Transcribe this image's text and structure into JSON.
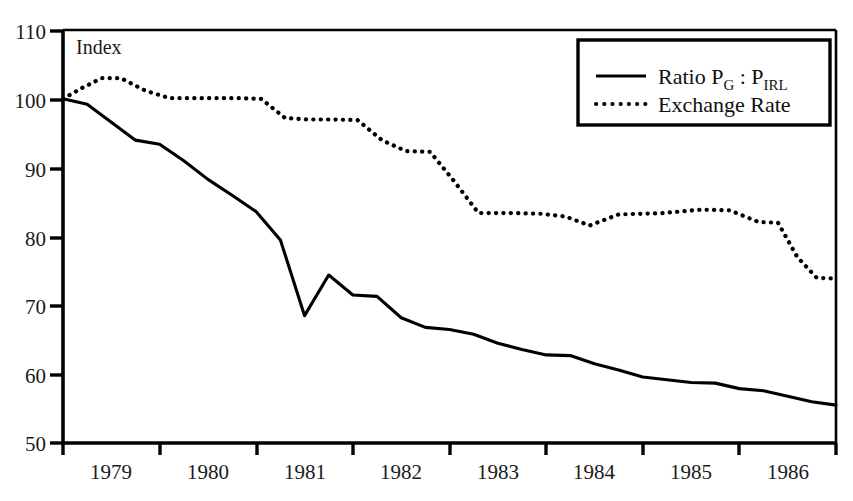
{
  "chart_data": {
    "type": "line",
    "title": "",
    "xlabel": "",
    "ylabel": "Index",
    "axis_corner_label": "Index",
    "xlim": [
      1978.5,
      1986.5
    ],
    "ylim": [
      50,
      110
    ],
    "grid": false,
    "legend_position": "top-right",
    "y_ticks": [
      50,
      60,
      70,
      80,
      90,
      100,
      110
    ],
    "y_tick_labels": [
      "50",
      "60",
      "70",
      "80",
      "90",
      "100",
      "110"
    ],
    "x_tick_labels": [
      "1979",
      "1980",
      "1981",
      "1982",
      "1983",
      "1984",
      "1985",
      "1986"
    ],
    "x_tick_values": [
      1979,
      1980,
      1981,
      1982,
      1983,
      1984,
      1985,
      1986
    ],
    "x_boundary_ticks": [
      1978.5,
      1979.5,
      1980.5,
      1981.5,
      1982.5,
      1983.5,
      1984.5,
      1985.5,
      1986.5
    ],
    "colors": {
      "line": "#000000",
      "axis": "#000000",
      "background": "#ffffff",
      "text": "#1a1a1a"
    },
    "series": [
      {
        "name": "Ratio P_G : P_IRL",
        "legend_label_main": "Ratio P",
        "legend_sub_1": "G",
        "legend_mid": " : P",
        "legend_sub_2": "IRL",
        "style": "solid",
        "x": [
          1978.5,
          1978.75,
          1979.0,
          1979.25,
          1979.5,
          1979.75,
          1980.0,
          1980.25,
          1980.5,
          1980.75,
          1981.0,
          1981.25,
          1981.5,
          1981.75,
          1982.0,
          1982.25,
          1982.5,
          1982.75,
          1983.0,
          1983.25,
          1983.5,
          1983.75,
          1984.0,
          1984.25,
          1984.5,
          1984.75,
          1985.0,
          1985.25,
          1985.5,
          1985.75,
          1986.0,
          1986.25,
          1986.5
        ],
        "values": [
          100.0,
          99.2,
          96.6,
          94.0,
          93.4,
          91.0,
          88.3,
          86.0,
          83.6,
          79.5,
          68.5,
          74.4,
          71.5,
          71.3,
          68.2,
          66.8,
          66.5,
          65.8,
          64.5,
          63.6,
          62.8,
          62.7,
          61.5,
          60.6,
          59.6,
          59.2,
          58.8,
          58.7,
          57.9,
          57.6,
          56.8,
          56.0,
          55.5
        ]
      },
      {
        "name": "Exchange Rate",
        "legend_label_main": "Exchange Rate",
        "style": "dotted",
        "x": [
          1978.5,
          1978.7,
          1978.9,
          1979.1,
          1979.35,
          1979.6,
          1980.0,
          1980.3,
          1980.55,
          1980.8,
          1981.05,
          1981.3,
          1981.55,
          1981.8,
          1982.05,
          1982.3,
          1982.55,
          1982.8,
          1983.2,
          1983.45,
          1983.7,
          1983.95,
          1984.25,
          1984.7,
          1985.1,
          1985.4,
          1985.7,
          1985.9,
          1986.1,
          1986.3,
          1986.5
        ],
        "values": [
          100.0,
          101.6,
          103.0,
          103.0,
          101.2,
          100.1,
          100.1,
          100.1,
          100.0,
          97.2,
          97.0,
          97.0,
          96.9,
          94.0,
          92.4,
          92.3,
          88.0,
          83.4,
          83.4,
          83.3,
          82.9,
          81.6,
          83.2,
          83.4,
          83.9,
          83.8,
          82.1,
          82.0,
          77.0,
          74.0,
          73.9
        ]
      }
    ]
  },
  "legend": {
    "items": [
      {
        "label_main": "Ratio P",
        "sub_1": "G",
        "mid": " : P",
        "sub_2": "IRL",
        "style": "solid"
      },
      {
        "label_main": "Exchange Rate",
        "style": "dotted"
      }
    ]
  }
}
